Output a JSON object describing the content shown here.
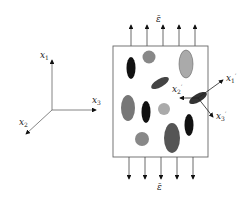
{
  "diagram": {
    "global_axes": {
      "x1": "x",
      "x1_sub": "1",
      "x2": "x",
      "x2_sub": "2",
      "x3": "x",
      "x3_sub": "3"
    },
    "local_axes": {
      "x1p": "x",
      "x1p_sub": "1",
      "x1p_prime": "′",
      "x2p": "x",
      "x2p_sub": "2",
      "x2p_prime": "′",
      "x3p": "x",
      "x3p_sub": "3",
      "x3p_prime": "′"
    },
    "strain_top": "ε̄",
    "strain_bottom": "ε̄",
    "colors": {
      "black": "#111111",
      "dark_gray": "#4a4a4a",
      "mid_gray": "#777777",
      "light_gray": "#a8a8a8",
      "outline": "#555555"
    }
  }
}
